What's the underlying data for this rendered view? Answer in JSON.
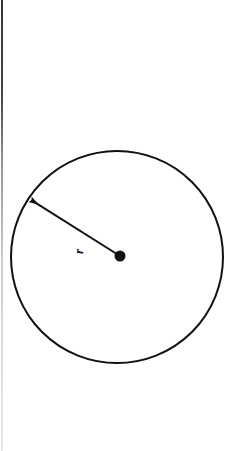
{
  "figure": {
    "domain_note": "geometric diagram of a circle with labeled radius",
    "background_color": "#ffffff",
    "ink_color": "#111111",
    "canvas": {
      "width": 238,
      "height": 451
    }
  },
  "labels": {
    "radius_label": "r",
    "radius_label_rotation_deg": -90
  },
  "chart_data": {
    "type": "diagram",
    "title": "",
    "xlabel": "",
    "ylabel": "",
    "shapes": [
      {
        "name": "circle-outline",
        "kind": "circle",
        "center": {
          "x": 117,
          "y": 257
        },
        "radius": 106,
        "stroke": "#111111",
        "stroke_width": 2,
        "fill": "none"
      },
      {
        "name": "center-point",
        "kind": "dot",
        "center": {
          "x": 120,
          "y": 256
        },
        "radius": 5.5,
        "fill": "#111111"
      },
      {
        "name": "radius-arrow",
        "kind": "arrow",
        "from": {
          "x": 120,
          "y": 256
        },
        "to": {
          "x": 36,
          "y": 203
        },
        "stroke": "#111111",
        "stroke_width": 2,
        "arrowhead_at": "to",
        "label": "r"
      }
    ],
    "annotations": [
      {
        "name": "radius-label",
        "text": "r",
        "position": {
          "x": 82,
          "y": 251
        },
        "rotation_deg": -90
      }
    ],
    "legend": [],
    "grid": false
  }
}
